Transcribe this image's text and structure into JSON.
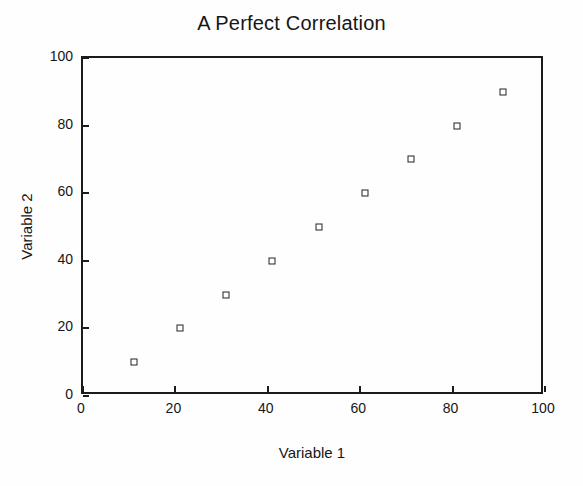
{
  "chart_data": {
    "type": "scatter",
    "title": "A Perfect Correlation",
    "xlabel": "Variable 1",
    "ylabel": "Variable 2",
    "xlim": [
      0,
      100
    ],
    "ylim": [
      0,
      100
    ],
    "grid": false,
    "legend": null,
    "marker": "open-square",
    "marker_color": "#222222",
    "frame_color": "#1b1b1b",
    "background_color": "#fefefe",
    "xticks": [
      0,
      20,
      40,
      60,
      80,
      100
    ],
    "yticks": [
      0,
      20,
      40,
      60,
      80,
      100
    ],
    "xtick_labels": [
      "0",
      "20",
      "40",
      "60",
      "80",
      "100"
    ],
    "ytick_labels": [
      "0",
      "20",
      "40",
      "60",
      "80",
      "100"
    ],
    "series": [
      {
        "name": "Variable 2 vs Variable 1",
        "x": [
          11,
          21,
          31,
          41,
          51,
          61,
          71,
          81,
          91
        ],
        "y": [
          10,
          20,
          30,
          40,
          50,
          60,
          70,
          80,
          90
        ]
      }
    ],
    "points": [
      {
        "x": 11,
        "y": 10
      },
      {
        "x": 21,
        "y": 20
      },
      {
        "x": 31,
        "y": 30
      },
      {
        "x": 41,
        "y": 40
      },
      {
        "x": 51,
        "y": 50
      },
      {
        "x": 61,
        "y": 60
      },
      {
        "x": 71,
        "y": 70
      },
      {
        "x": 81,
        "y": 80
      },
      {
        "x": 91,
        "y": 90
      }
    ]
  }
}
